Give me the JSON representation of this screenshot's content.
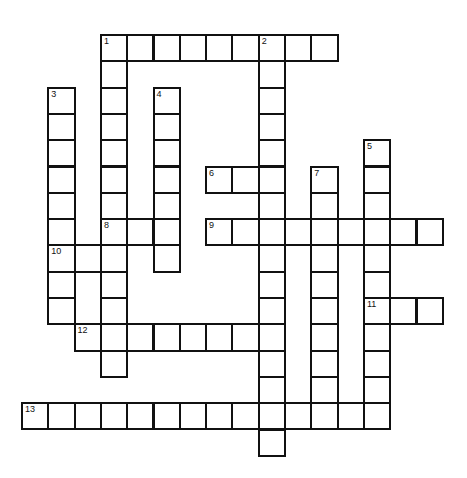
{
  "puzzle": {
    "grid": {
      "origin_x": 21,
      "origin_y": 34,
      "pitch": 26.3
    },
    "colors": {
      "border": "#111111",
      "cell": "#ffffff",
      "background": "#ffffff"
    },
    "entries": [
      {
        "number": "1",
        "direction": "across",
        "row": 0,
        "col": 3,
        "length": 9
      },
      {
        "number": "1",
        "direction": "down",
        "row": 0,
        "col": 3,
        "length": 13
      },
      {
        "number": "2",
        "direction": "down",
        "row": 0,
        "col": 9,
        "length": 16
      },
      {
        "number": "3",
        "direction": "down",
        "row": 2,
        "col": 1,
        "length": 9
      },
      {
        "number": "4",
        "direction": "down",
        "row": 2,
        "col": 5,
        "length": 7
      },
      {
        "number": "5",
        "direction": "down",
        "row": 4,
        "col": 13,
        "length": 11
      },
      {
        "number": "6",
        "direction": "across",
        "row": 5,
        "col": 7,
        "length": 3
      },
      {
        "number": "7",
        "direction": "down",
        "row": 5,
        "col": 11,
        "length": 10
      },
      {
        "number": "8",
        "direction": "across",
        "row": 7,
        "col": 3,
        "length": 3
      },
      {
        "number": "9",
        "direction": "across",
        "row": 7,
        "col": 7,
        "length": 9
      },
      {
        "number": "10",
        "direction": "across",
        "row": 8,
        "col": 1,
        "length": 3
      },
      {
        "number": "11",
        "direction": "across",
        "row": 10,
        "col": 13,
        "length": 3
      },
      {
        "number": "12",
        "direction": "across",
        "row": 11,
        "col": 2,
        "length": 8
      },
      {
        "number": "13",
        "direction": "across",
        "row": 14,
        "col": 0,
        "length": 14
      }
    ]
  }
}
